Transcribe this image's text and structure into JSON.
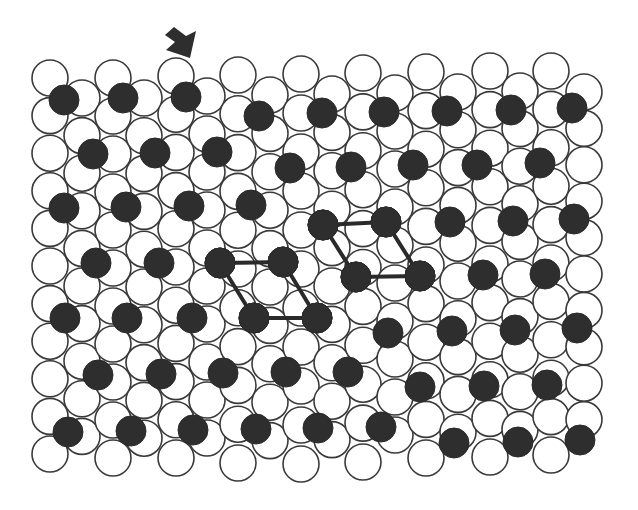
{
  "diagram": {
    "title": "",
    "colors": {
      "background": "#ffffff",
      "white_atom_fill": "#ffffff",
      "atom_outline": "#3a3a3a",
      "dark_atom_fill": "#2e2e2e",
      "bond": "#2a2a2a",
      "arrow": "#2e2e2e"
    },
    "arrow": {
      "direction": "down-right",
      "points": [
        [
          174,
          27
        ],
        [
          186,
          36
        ],
        [
          196,
          31
        ],
        [
          190,
          58
        ],
        [
          166,
          50
        ],
        [
          175,
          42
        ],
        [
          165,
          35
        ]
      ]
    },
    "white_lattice": {
      "radius": 18,
      "columns": [
        {
          "x": 50,
          "y0": 78,
          "count": 11,
          "dy": 37.6
        },
        {
          "x": 82,
          "y0": 98,
          "count": 10,
          "dy": 37.6
        },
        {
          "x": 113,
          "y0": 78,
          "count": 11,
          "dy": 38.0
        },
        {
          "x": 144,
          "y0": 98,
          "count": 10,
          "dy": 37.8
        },
        {
          "x": 176,
          "y0": 76,
          "count": 11,
          "dy": 38.2
        },
        {
          "x": 207,
          "y0": 96,
          "count": 10,
          "dy": 38.0
        },
        {
          "x": 238,
          "y0": 75,
          "count": 11,
          "dy": 38.8
        },
        {
          "x": 270,
          "y0": 95,
          "count": 10,
          "dy": 38.4
        },
        {
          "x": 301,
          "y0": 74,
          "count": 11,
          "dy": 39.0
        },
        {
          "x": 332,
          "y0": 94,
          "count": 10,
          "dy": 38.4
        },
        {
          "x": 363,
          "y0": 73,
          "count": 11,
          "dy": 38.9
        },
        {
          "x": 395,
          "y0": 93,
          "count": 10,
          "dy": 38.0
        },
        {
          "x": 426,
          "y0": 72,
          "count": 11,
          "dy": 38.6
        },
        {
          "x": 458,
          "y0": 92,
          "count": 10,
          "dy": 37.8
        },
        {
          "x": 490,
          "y0": 71,
          "count": 11,
          "dy": 38.6
        },
        {
          "x": 520,
          "y0": 91,
          "count": 10,
          "dy": 37.6
        },
        {
          "x": 551,
          "y0": 71,
          "count": 11,
          "dy": 38.4
        },
        {
          "x": 584,
          "y0": 92,
          "count": 10,
          "dy": 36.4
        }
      ]
    },
    "dark_atoms": {
      "radius": 15,
      "rows": [
        [
          [
            64,
            100
          ],
          [
            123,
            98
          ],
          [
            186,
            97
          ],
          [
            259,
            116
          ],
          [
            322,
            113
          ],
          [
            384,
            112
          ],
          [
            447,
            111
          ],
          [
            511,
            110
          ],
          [
            572,
            108
          ]
        ],
        [
          [
            93,
            154
          ],
          [
            155,
            153
          ],
          [
            217,
            152
          ],
          [
            290,
            168
          ],
          [
            351,
            167
          ],
          [
            413,
            165
          ],
          [
            477,
            165
          ],
          [
            540,
            163
          ]
        ],
        [
          [
            64,
            208
          ],
          [
            126,
            207
          ],
          [
            189,
            206
          ],
          [
            251,
            205
          ],
          [
            323,
            225
          ],
          [
            386,
            222
          ],
          [
            450,
            222
          ],
          [
            513,
            221
          ],
          [
            574,
            219
          ]
        ],
        [
          [
            96,
            263
          ],
          [
            159,
            263
          ],
          [
            220,
            263
          ],
          [
            283,
            262
          ],
          [
            356,
            277
          ],
          [
            420,
            276
          ],
          [
            483,
            275
          ],
          [
            545,
            274
          ]
        ],
        [
          [
            65,
            318
          ],
          [
            127,
            318
          ],
          [
            192,
            318
          ],
          [
            254,
            318
          ],
          [
            317,
            318
          ],
          [
            388,
            333
          ],
          [
            452,
            331
          ],
          [
            515,
            330
          ],
          [
            577,
            328
          ]
        ],
        [
          [
            98,
            375
          ],
          [
            161,
            374
          ],
          [
            223,
            373
          ],
          [
            286,
            372
          ],
          [
            348,
            372
          ],
          [
            420,
            387
          ],
          [
            484,
            386
          ],
          [
            547,
            385
          ]
        ],
        [
          [
            68,
            432
          ],
          [
            131,
            431
          ],
          [
            193,
            430
          ],
          [
            256,
            429
          ],
          [
            318,
            428
          ],
          [
            381,
            427
          ],
          [
            454,
            443
          ],
          [
            518,
            442
          ],
          [
            580,
            440
          ]
        ]
      ]
    },
    "unit_cells": [
      {
        "name": "unit-cell-left",
        "bonds": [
          [
            [
              220,
              263
            ],
            [
              283,
              262
            ]
          ],
          [
            [
              254,
              318
            ],
            [
              317,
              318
            ]
          ],
          [
            [
              220,
              263
            ],
            [
              254,
              318
            ]
          ],
          [
            [
              283,
              262
            ],
            [
              317,
              318
            ]
          ]
        ]
      },
      {
        "name": "unit-cell-right",
        "bonds": [
          [
            [
              323,
              225
            ],
            [
              386,
              222
            ]
          ],
          [
            [
              356,
              277
            ],
            [
              420,
              276
            ]
          ],
          [
            [
              323,
              225
            ],
            [
              356,
              277
            ]
          ],
          [
            [
              386,
              222
            ],
            [
              420,
              276
            ]
          ]
        ]
      }
    ]
  }
}
